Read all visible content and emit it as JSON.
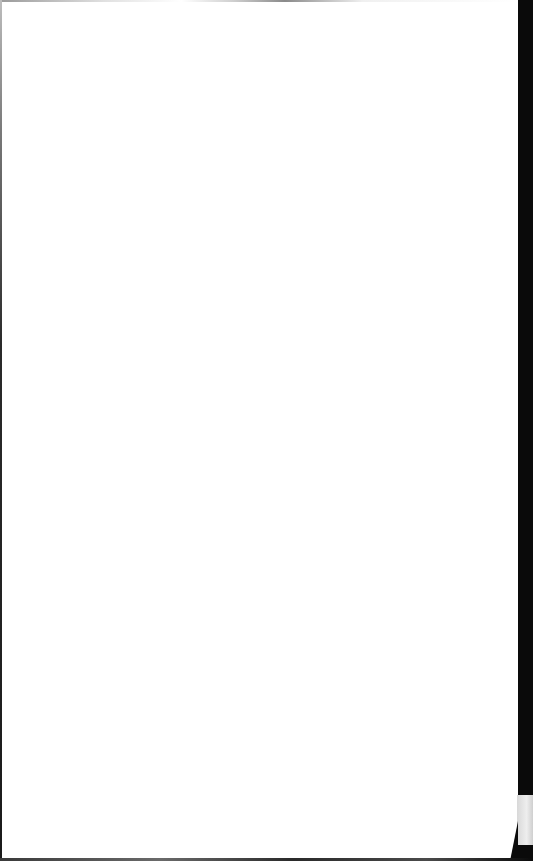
{
  "document": {
    "type": "scanned-blank-page",
    "text_content": "",
    "colors": {
      "paper": "#ffffff",
      "scan_border": "#0a0a0a",
      "fold_highlight": "#e4e4e4"
    }
  }
}
